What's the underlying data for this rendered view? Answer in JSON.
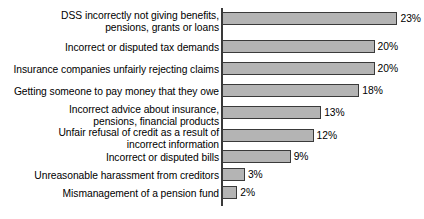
{
  "chart_data": {
    "type": "bar",
    "orientation": "horizontal",
    "title": "",
    "subtitle": "",
    "xlabel": "",
    "ylabel": "",
    "xlim": [
      0,
      26
    ],
    "grid": false,
    "legend": null,
    "value_suffix": "%",
    "categories": [
      "DSS incorrectly not giving benefits,\npensions, grants or loans",
      "Incorrect or disputed tax demands",
      "Insurance companies unfairly rejecting claims",
      "Getting someone to pay money that they owe",
      "Incorrect advice about insurance,\npensions, financial products",
      "Unfair refusal of credit as a result of\nincorrect information",
      "Incorrect or disputed bills",
      "Unreasonable harassment from creditors",
      "Mismanagement of a pension fund"
    ],
    "values": [
      23,
      20,
      20,
      18,
      13,
      12,
      9,
      3,
      2
    ],
    "value_labels": [
      "23%",
      "20%",
      "20%",
      "18%",
      "13%",
      "12%",
      "9%",
      "3%",
      "2%"
    ],
    "colors": {
      "bar_fill": "#b4b4b4",
      "bar_stroke": "#3a3a3a",
      "axis": "#3a3a3a",
      "text": "#000000",
      "background": "#ffffff"
    }
  },
  "layout": {
    "bar_tops": [
      12,
      40,
      62,
      84,
      106,
      129,
      150,
      168,
      186
    ],
    "label_tops": [
      10,
      42,
      64,
      86,
      104,
      127,
      152,
      170,
      188
    ],
    "px_per_unit": 7.63,
    "bar_origin_x": 222,
    "bar_height": 13
  }
}
